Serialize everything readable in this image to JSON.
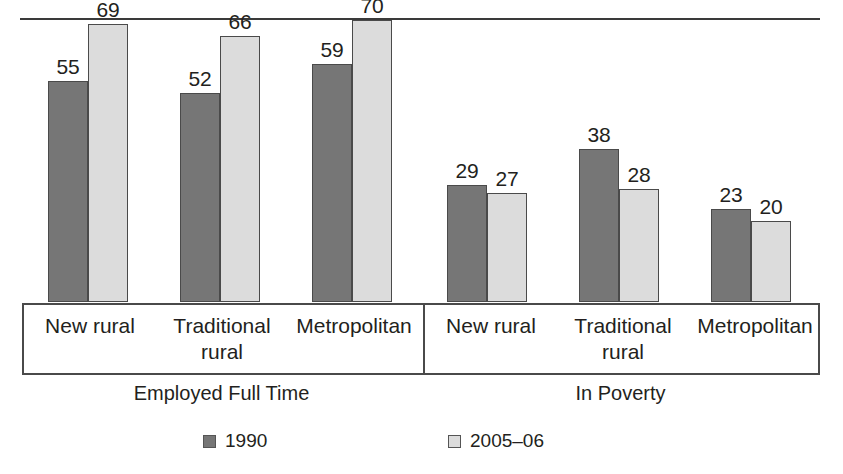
{
  "chart_data": {
    "type": "bar",
    "title": "",
    "xlabel": "",
    "ylabel": "",
    "ylim": [
      0,
      75
    ],
    "grid": false,
    "legend_position": "bottom",
    "panels": [
      {
        "name": "Employed Full Time",
        "categories": [
          "New rural",
          "Traditional rural",
          "Metropolitan"
        ],
        "series": [
          {
            "name": "1990",
            "values": [
              55,
              52,
              59
            ]
          },
          {
            "name": "2005–06",
            "values": [
              69,
              66,
              70
            ]
          }
        ]
      },
      {
        "name": "In Poverty",
        "categories": [
          "New rural",
          "Traditional rural",
          "Metropolitan"
        ],
        "series": [
          {
            "name": "1990",
            "values": [
              29,
              38,
              23
            ]
          },
          {
            "name": "2005–06",
            "values": [
              27,
              28,
              20
            ]
          }
        ]
      }
    ],
    "legend": [
      {
        "label": "1990",
        "color": "#767676"
      },
      {
        "label": "2005–06",
        "color": "#dcdcdc"
      }
    ],
    "colors": {
      "series_1990": "#767676",
      "series_2005_06": "#dcdcdc",
      "outline": "#4a4a4a",
      "text": "#231f20"
    }
  },
  "panels": {
    "left": {
      "title": "Employed Full Time",
      "ticks": [
        "New rural",
        "Traditional<br>rural",
        "Metropolitan"
      ],
      "groups": [
        {
          "category": "New rural",
          "v1990": "55",
          "v2005": "69"
        },
        {
          "category": "Traditional rural",
          "v1990": "52",
          "v2005": "66"
        },
        {
          "category": "Metropolitan",
          "v1990": "59",
          "v2005": "70"
        }
      ]
    },
    "right": {
      "title": "In Poverty",
      "ticks": [
        "New rural",
        "Traditional<br>rural",
        "Metropolitan"
      ],
      "groups": [
        {
          "category": "New rural",
          "v1990": "29",
          "v2005": "27"
        },
        {
          "category": "Traditional rural",
          "v1990": "38",
          "v2005": "28"
        },
        {
          "category": "Metropolitan",
          "v1990": "23",
          "v2005": "20"
        }
      ]
    }
  },
  "legend": {
    "items": [
      {
        "label": "1990"
      },
      {
        "label": "2005–06"
      }
    ]
  }
}
